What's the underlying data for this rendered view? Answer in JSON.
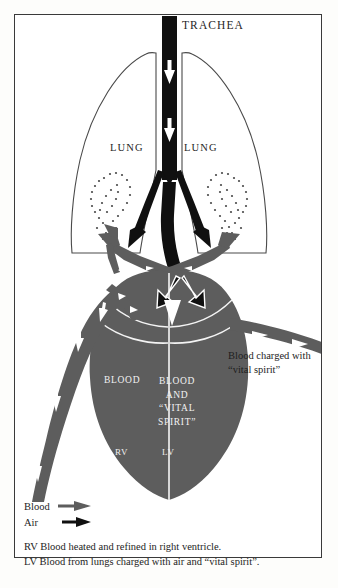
{
  "figure": {
    "border_color": "#3a3a3a",
    "background": "#ffffff"
  },
  "colors": {
    "blood_vessel": "#5d5d5d",
    "air_passage": "#101010",
    "heart_fill": "#5d5d5d",
    "arrow_white": "#ffffff",
    "text": "#1d1d1d",
    "text_on_dark": "#f2f2f2",
    "stipple": "#4a4a4a"
  },
  "labels": {
    "trachea": "TRACHEA",
    "lung_left": "LUNG",
    "lung_right": "LUNG",
    "blood_rv": "BLOOD",
    "blood_lv": "BLOOD\nAND\n“VITAL\nSPIRIT”",
    "rv": "RV",
    "lv": "LV"
  },
  "callout": {
    "text": "Blood charged with “vital spirit”"
  },
  "legend": {
    "items": [
      {
        "key": "Blood",
        "arrow": "blood-arrow-icon",
        "color": "#5d5d5d"
      },
      {
        "key": "Air",
        "arrow": "air-arrow-icon",
        "color": "#101010"
      }
    ]
  },
  "caption": {
    "line1": "RV Blood heated and refined in right ventricle.",
    "line2": "LV Blood from lungs charged with air and “vital spirit”."
  },
  "icons": {
    "down_arrow": "down-arrow-icon",
    "bronchus_arrow": "bronchus-arrow-icon",
    "vessel_arrow": "vessel-arrow-icon",
    "aorta_arrow": "aorta-arrow-icon",
    "vena_cava_arrow": "vena-cava-arrow-icon",
    "air_into_lv_arrow": "air-into-lv-arrow-icon",
    "white_v_arrow": "white-v-arrow-icon"
  }
}
